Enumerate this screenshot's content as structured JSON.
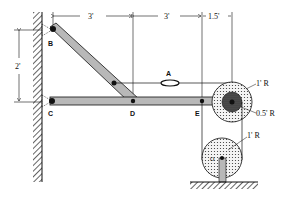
{
  "diagram": {
    "points": {
      "A": "A",
      "B": "B",
      "C": "C",
      "D": "D",
      "E": "E",
      "O": "O"
    },
    "dimensions": {
      "top_1": "3'",
      "top_2": "3'",
      "top_3": "1.5'",
      "left_vertical": "2'"
    },
    "radius_labels": {
      "upper_outer": "1' R",
      "upper_inner": "0.5' R",
      "lower": "1' R"
    },
    "colors": {
      "line": "#111111",
      "member_fill": "#b8b8b8",
      "pulley_fill": "#e0e0e0",
      "hub_fill": "#3a3a3a"
    }
  }
}
